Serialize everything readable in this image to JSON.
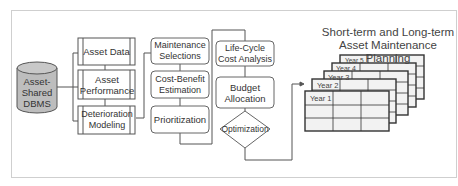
{
  "diagram": {
    "database": {
      "label": "Asset-Shared DBMS",
      "lines": [
        "Asset-",
        "Shared",
        "DBMS"
      ]
    },
    "data_modules": [
      {
        "label": "Asset Data"
      },
      {
        "label": "Asset Performance"
      },
      {
        "label": "Deterioration Modeling"
      }
    ],
    "analysis_modules": [
      {
        "label": "Maintenance Selections"
      },
      {
        "label": "Cost-Benefit Estimation"
      },
      {
        "label": "Prioritization"
      }
    ],
    "planning_modules": [
      {
        "label": "Life-Cycle Cost Analysis"
      },
      {
        "label": "Budget Allocation"
      }
    ],
    "decision": {
      "label": "Optimization"
    },
    "output": {
      "title_line1": "Short-term and Long-term",
      "title_line2": "Asset Maintenance Planning",
      "years": [
        "Year 1",
        "Year 2",
        "Year 3",
        "Year 4",
        "Year 5"
      ]
    },
    "colors": {
      "border": "#555555",
      "db_fill": "#bdbdbd",
      "table_fill": "#f2f2f2",
      "frame": "#cfcfcf"
    }
  }
}
